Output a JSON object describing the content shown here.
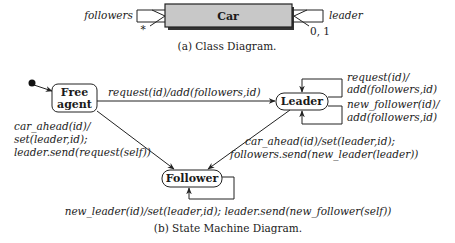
{
  "class_diagram": {
    "class_name": "Car",
    "left_role": "followers",
    "left_multiplicity": "*",
    "right_role": "leader",
    "right_multiplicity": "0, 1",
    "caption": "(a) Class Diagram.",
    "class_fill": "#c8c8c8"
  },
  "state_machine": {
    "states": {
      "free_agent_line1": "Free",
      "free_agent_line2": "agent",
      "leader": "Leader",
      "follower": "Follower"
    },
    "transitions": {
      "free_to_leader": "request(id)/add(followers,id)",
      "leader_self_1_line1": "request(id)/",
      "leader_self_1_line2": "add(followers,id)",
      "leader_self_2_line1": "new_follower(id)/",
      "leader_self_2_line2": "add(followers,id)",
      "free_to_follower_line1": "car_ahead(id)/",
      "free_to_follower_line2": "set(leader,id);",
      "free_to_follower_line3": "leader.send(request(self))",
      "leader_to_follower_line1": "car_ahead(id)/set(leader,id);",
      "leader_to_follower_line2": "followers.send(new_leader(leader))",
      "follower_self": "new_leader(id)/set(leader,id); leader.send(new_follower(self))"
    },
    "caption": "(b) State Machine Diagram."
  }
}
